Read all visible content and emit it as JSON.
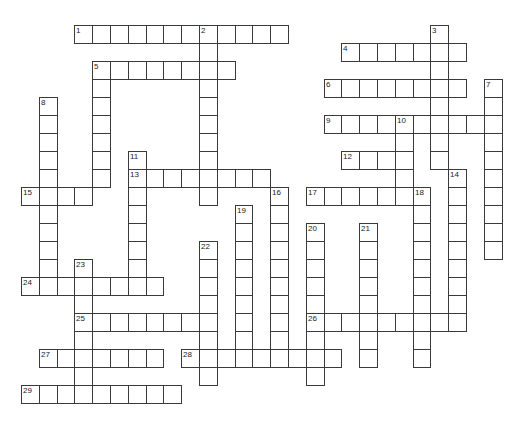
{
  "puzzle": {
    "type": "crossword",
    "grid": {
      "origin_x": 21,
      "origin_y": 25,
      "cell_w": 17.8,
      "cell_h": 18,
      "border_color": "#3a3a3a",
      "background": "#ffffff"
    },
    "entries": [
      {
        "number": "1",
        "direction": "across",
        "row": 0,
        "col": 3,
        "length": 12
      },
      {
        "number": "2",
        "direction": "down",
        "row": 0,
        "col": 10,
        "length": 10
      },
      {
        "number": "3",
        "direction": "down",
        "row": 0,
        "col": 23,
        "length": 8
      },
      {
        "number": "4",
        "direction": "across",
        "row": 1,
        "col": 18,
        "length": 7
      },
      {
        "number": "5",
        "direction": "across",
        "row": 2,
        "col": 4,
        "length": 8
      },
      {
        "number": "5",
        "direction": "down",
        "row": 2,
        "col": 4,
        "length": 7
      },
      {
        "number": "6",
        "direction": "across",
        "row": 3,
        "col": 17,
        "length": 8
      },
      {
        "number": "7",
        "direction": "down",
        "row": 3,
        "col": 26,
        "length": 10
      },
      {
        "number": "8",
        "direction": "down",
        "row": 4,
        "col": 1,
        "length": 11
      },
      {
        "number": "9",
        "direction": "across",
        "row": 5,
        "col": 17,
        "length": 10
      },
      {
        "number": "10",
        "direction": "down",
        "row": 5,
        "col": 21,
        "length": 5
      },
      {
        "number": "11",
        "direction": "down",
        "row": 7,
        "col": 6,
        "length": 8
      },
      {
        "number": "12",
        "direction": "across",
        "row": 7,
        "col": 18,
        "length": 4
      },
      {
        "number": "13",
        "direction": "across",
        "row": 8,
        "col": 6,
        "length": 8
      },
      {
        "number": "14",
        "direction": "down",
        "row": 8,
        "col": 24,
        "length": 9
      },
      {
        "number": "15",
        "direction": "across",
        "row": 9,
        "col": 0,
        "length": 4
      },
      {
        "number": "16",
        "direction": "down",
        "row": 9,
        "col": 14,
        "length": 10
      },
      {
        "number": "17",
        "direction": "across",
        "row": 9,
        "col": 16,
        "length": 6
      },
      {
        "number": "18",
        "direction": "down",
        "row": 9,
        "col": 22,
        "length": 10
      },
      {
        "number": "19",
        "direction": "down",
        "row": 10,
        "col": 12,
        "length": 9
      },
      {
        "number": "20",
        "direction": "down",
        "row": 11,
        "col": 16,
        "length": 9
      },
      {
        "number": "21",
        "direction": "down",
        "row": 11,
        "col": 19,
        "length": 8
      },
      {
        "number": "22",
        "direction": "down",
        "row": 12,
        "col": 10,
        "length": 8
      },
      {
        "number": "23",
        "direction": "down",
        "row": 13,
        "col": 3,
        "length": 8
      },
      {
        "number": "24",
        "direction": "across",
        "row": 14,
        "col": 0,
        "length": 8
      },
      {
        "number": "25",
        "direction": "across",
        "row": 16,
        "col": 3,
        "length": 8
      },
      {
        "number": "26",
        "direction": "across",
        "row": 16,
        "col": 16,
        "length": 9
      },
      {
        "number": "27",
        "direction": "across",
        "row": 18,
        "col": 1,
        "length": 7
      },
      {
        "number": "28",
        "direction": "across",
        "row": 18,
        "col": 9,
        "length": 9
      },
      {
        "number": "29",
        "direction": "across",
        "row": 20,
        "col": 0,
        "length": 9
      }
    ]
  }
}
